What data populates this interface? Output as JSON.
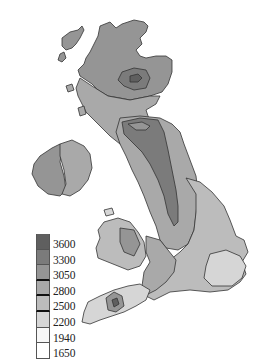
{
  "map": {
    "type": "choropleth",
    "region": "Great Britain and Ireland",
    "colors": {
      "c3600": "#5f5f5f",
      "c3300": "#7b7b7b",
      "c3050": "#959595",
      "c2800": "#a9a9a9",
      "c2500": "#bcbcbc",
      "c2200": "#d6d6d6",
      "c1940": "#f4f4f4",
      "c1650": "#ffffff",
      "outline": "#333333"
    }
  },
  "legend": {
    "items": [
      {
        "label": "3600",
        "color": "#5f5f5f",
        "border": "thin"
      },
      {
        "label": "3300",
        "color": "#7b7b7b",
        "border": "thin"
      },
      {
        "label": "3050",
        "color": "#959595",
        "border": "thick"
      },
      {
        "label": "2800",
        "color": "#a9a9a9",
        "border": "thick"
      },
      {
        "label": "2500",
        "color": "#bcbcbc",
        "border": "thick"
      },
      {
        "label": "2200",
        "color": "#d6d6d6",
        "border": "thick"
      },
      {
        "label": "1940",
        "color": "#f7f7f7",
        "border": "thin"
      },
      {
        "label": "1650",
        "color": "#ffffff",
        "border": "thin"
      }
    ]
  }
}
